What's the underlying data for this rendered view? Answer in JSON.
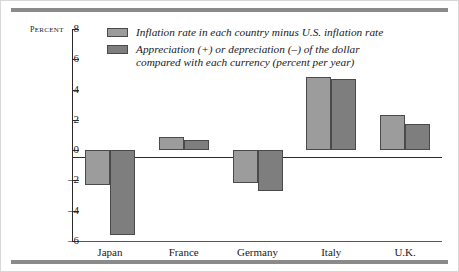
{
  "figure": {
    "top_rule": "top-rule",
    "bottom_rule": "bottom-rule"
  },
  "chart_data": {
    "type": "bar",
    "title": "",
    "xlabel": "",
    "ylabel": "Percent",
    "ylim": [
      -6,
      8
    ],
    "yticks": [
      8,
      6,
      4,
      2,
      0,
      -2,
      -4,
      -6
    ],
    "ytick_labels": [
      "8",
      "6",
      "4",
      "2",
      "0",
      "–2",
      "–4",
      "–6"
    ],
    "grid": false,
    "legend_position": "top-center",
    "categories": [
      "Japan",
      "France",
      "Germany",
      "Italy",
      "U.K."
    ],
    "series": [
      {
        "name": "Inflation rate in each country minus U.S. inflation rate",
        "color": "#9c9c9c",
        "values": [
          -2.3,
          0.9,
          -2.2,
          4.8,
          2.35
        ]
      },
      {
        "name": "Appreciation (+) or depreciation (–) of the dollar\ncompared with each currency (percent per year)",
        "color": "#7e7e7e",
        "values": [
          -5.6,
          0.7,
          -2.7,
          4.7,
          1.75
        ]
      }
    ]
  },
  "colors": {
    "series_light": "#9c9c9c",
    "series_dark": "#7e7e7e",
    "rule": "#8a8a8a",
    "axis": "#2b2b2b",
    "frame": "#d8d8d8"
  }
}
